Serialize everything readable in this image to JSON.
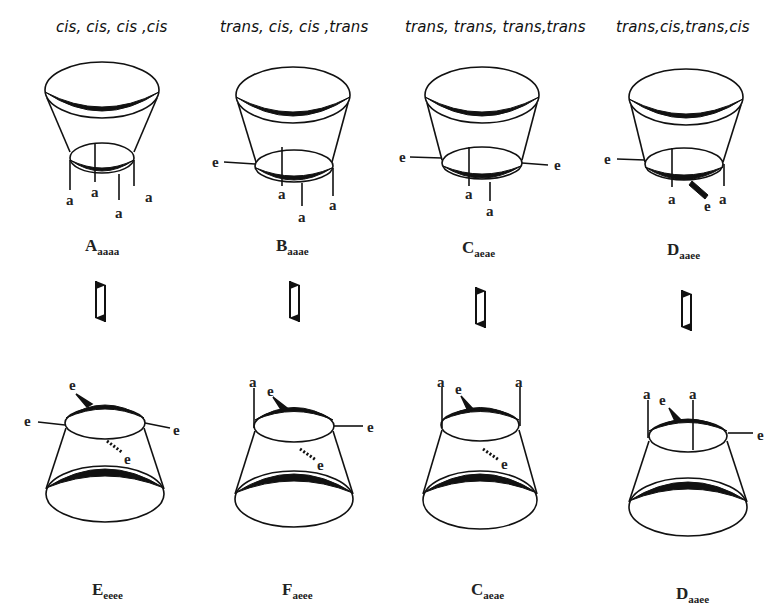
{
  "headers": [
    {
      "text": "cis, cis, cis ,cis"
    },
    {
      "text": "trans, cis, cis ,trans"
    },
    {
      "text": "trans, trans, trans,trans"
    },
    {
      "text": "trans,cis,trans,cis"
    }
  ],
  "top_row": [
    {
      "main": "A",
      "sub": "aaaa",
      "substituents": [
        "a",
        "a",
        "a",
        "a"
      ]
    },
    {
      "main": "B",
      "sub": "aaae",
      "substituents": [
        "e",
        "a",
        "a",
        "a"
      ]
    },
    {
      "main": "C",
      "sub": "aeae",
      "substituents": [
        "e",
        "a",
        "a",
        "e"
      ]
    },
    {
      "main": "D",
      "sub": "aaee",
      "substituents": [
        "e",
        "a",
        "e",
        "a"
      ]
    }
  ],
  "bottom_row": [
    {
      "main": "E",
      "sub": "eeee",
      "substituents": [
        "e",
        "e",
        "e",
        "e"
      ]
    },
    {
      "main": "F",
      "sub": "aeee",
      "substituents": [
        "a",
        "e",
        "e",
        "e"
      ]
    },
    {
      "main": "C",
      "sub": "aeae",
      "substituents": [
        "a",
        "e",
        "a",
        "e"
      ]
    },
    {
      "main": "D",
      "sub": "aaee",
      "substituents": [
        "a",
        "e",
        "a",
        "e"
      ]
    }
  ],
  "equilibrium_symbol": "⇅",
  "colors": {
    "ink": "#111111",
    "background": "#ffffff"
  }
}
